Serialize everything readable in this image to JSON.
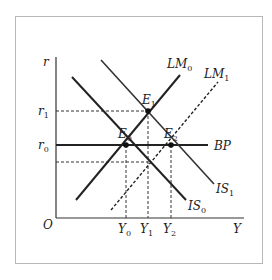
{
  "diagram": {
    "type": "IS-LM-BP",
    "axes": {
      "y_label": "r",
      "x_label": "Y",
      "origin_label": "O"
    },
    "y_ticks": [
      {
        "main": "r",
        "sub": "1"
      },
      {
        "main": "r",
        "sub": "0"
      }
    ],
    "x_ticks": [
      {
        "main": "Y",
        "sub": "0"
      },
      {
        "main": "Y",
        "sub": "1"
      },
      {
        "main": "Y",
        "sub": "2"
      }
    ],
    "curves": {
      "LM0": {
        "main": "LM",
        "sub": "0",
        "style": "solid"
      },
      "LM1": {
        "main": "LM",
        "sub": "1",
        "style": "dashed"
      },
      "IS0": {
        "main": "IS",
        "sub": "0",
        "style": "solid"
      },
      "IS1": {
        "main": "IS",
        "sub": "1",
        "style": "solid"
      },
      "BP": {
        "main": "BP",
        "sub": "",
        "style": "solid"
      }
    },
    "points": {
      "E0": {
        "main": "E",
        "sub": "0"
      },
      "E1": {
        "main": "E",
        "sub": "1"
      },
      "E2": {
        "main": "E",
        "sub": "2"
      }
    },
    "colors": {
      "line": "#222222",
      "frame": "#b8b8b8"
    }
  }
}
